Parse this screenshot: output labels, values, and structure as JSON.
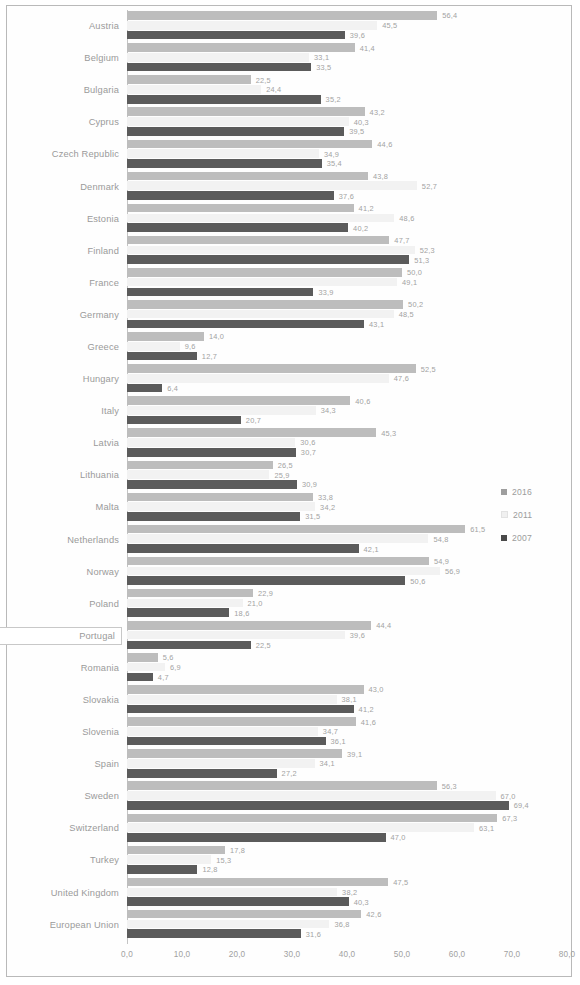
{
  "chart_data": {
    "type": "bar",
    "orientation": "horizontal",
    "title": "",
    "xlabel": "",
    "ylabel": "",
    "xlim": [
      0,
      80
    ],
    "grid": false,
    "legend_position": "right",
    "xticks": [
      "0,0",
      "10,0",
      "20,0",
      "30,0",
      "40,0",
      "50,0",
      "60,0",
      "70,0",
      "80,0"
    ],
    "xtick_values": [
      0,
      10,
      20,
      30,
      40,
      50,
      60,
      70,
      80
    ],
    "categories": [
      "Austria",
      "Belgium",
      "Bulgaria",
      "Cyprus",
      "Czech Republic",
      "Denmark",
      "Estonia",
      "Finland",
      "France",
      "Germany",
      "Greece",
      "Hungary",
      "Italy",
      "Latvia",
      "Lithuania",
      "Malta",
      "Netherlands",
      "Norway",
      "Poland",
      "Portugal",
      "Romania",
      "Slovakia",
      "Slovenia",
      "Spain",
      "Sweden",
      "Switzerland",
      "Turkey",
      "United Kingdom",
      "European Union"
    ],
    "selected_category": "Portugal",
    "series": [
      {
        "name": "2016",
        "color": "#bdbdbd",
        "values": [
          56.4,
          41.4,
          22.5,
          43.2,
          44.6,
          43.8,
          41.2,
          47.7,
          50.0,
          50.2,
          14.0,
          52.5,
          40.6,
          45.3,
          26.5,
          33.8,
          61.5,
          54.9,
          22.9,
          44.4,
          5.6,
          43.0,
          41.6,
          39.1,
          56.3,
          67.3,
          17.8,
          47.5,
          42.6
        ],
        "labels": [
          "56,4",
          "41,4",
          "22,5",
          "43,2",
          "44,6",
          "43,8",
          "41,2",
          "47,7",
          "50,0",
          "50,2",
          "14,0",
          "52,5",
          "40,6",
          "45,3",
          "26,5",
          "33,8",
          "61,5",
          "54,9",
          "22,9",
          "44,4",
          "5,6",
          "43,0",
          "41,6",
          "39,1",
          "56,3",
          "67,3",
          "17,8",
          "47,5",
          "42,6"
        ]
      },
      {
        "name": "2011",
        "color": "#f2f2f2",
        "values": [
          45.5,
          33.1,
          24.4,
          40.3,
          34.9,
          52.7,
          48.6,
          52.3,
          49.1,
          48.5,
          9.6,
          47.6,
          34.3,
          30.6,
          25.9,
          34.2,
          54.8,
          56.9,
          21.0,
          39.6,
          6.9,
          38.1,
          34.7,
          34.1,
          67.0,
          63.1,
          15.3,
          38.2,
          36.8
        ],
        "labels": [
          "45,5",
          "33,1",
          "24,4",
          "40,3",
          "34,9",
          "52,7",
          "48,6",
          "52,3",
          "49,1",
          "48,5",
          "9,6",
          "47,6",
          "34,3",
          "30,6",
          "25,9",
          "34,2",
          "54,8",
          "56,9",
          "21,0",
          "39,6",
          "6,9",
          "38,1",
          "34,7",
          "34,1",
          "67,0",
          "63,1",
          "15,3",
          "38,2",
          "36,8"
        ]
      },
      {
        "name": "2007",
        "color": "#5b5b5b",
        "values": [
          39.6,
          33.5,
          35.2,
          39.5,
          35.4,
          37.6,
          40.2,
          51.3,
          33.9,
          43.1,
          12.7,
          6.4,
          20.7,
          30.7,
          30.9,
          31.5,
          42.1,
          50.6,
          18.6,
          22.5,
          4.7,
          41.2,
          36.1,
          27.2,
          69.4,
          47.0,
          12.8,
          40.3,
          31.6
        ],
        "labels": [
          "39,6",
          "33,5",
          "35,2",
          "39,5",
          "35,4",
          "37,6",
          "40,2",
          "51,3",
          "33,9",
          "43,1",
          "12,7",
          "6,4",
          "20,7",
          "30,7",
          "30,9",
          "31,5",
          "42,1",
          "50,6",
          "18,6",
          "22,5",
          "4,7",
          "41,2",
          "36,1",
          "27,2",
          "69,4",
          "47,0",
          "12,8",
          "40,3",
          "31,6"
        ]
      }
    ],
    "legend": [
      "2016",
      "2011",
      "2007"
    ]
  }
}
